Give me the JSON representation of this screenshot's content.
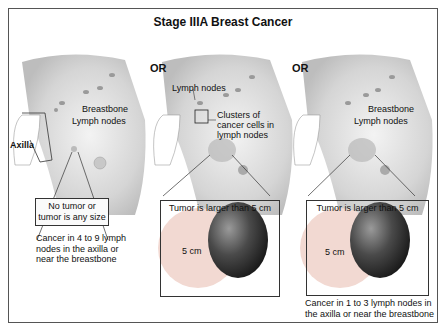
{
  "title": "Stage IIIA Breast Cancer",
  "separator": "OR",
  "panels": [
    {
      "labels": {
        "breastbone": "Breastbone",
        "lymph_nodes": "Lymph nodes",
        "axilla": "Axilla"
      },
      "callout": "No tumor or tumor is any size",
      "caption": "Cancer in 4 to 9 lymph nodes in the axilla or near the breastbone"
    },
    {
      "labels": {
        "lymph_nodes": "Lymph nodes",
        "clusters": "Clusters of cancer cells in lymph nodes"
      },
      "callout": "Tumor is larger than 5 cm",
      "size_label": "5 cm",
      "caption": ""
    },
    {
      "labels": {
        "breastbone": "Breastbone",
        "lymph_nodes": "Lymph nodes"
      },
      "callout": "Tumor is larger than 5 cm",
      "size_label": "5 cm",
      "caption": "Cancer in 1 to 3 lymph nodes in the axilla or near the breastbone"
    }
  ],
  "colors": {
    "skin": "#d8d8d8",
    "circle": "#f2d9d2",
    "lime": "#3a3a3a",
    "border": "#555555"
  }
}
